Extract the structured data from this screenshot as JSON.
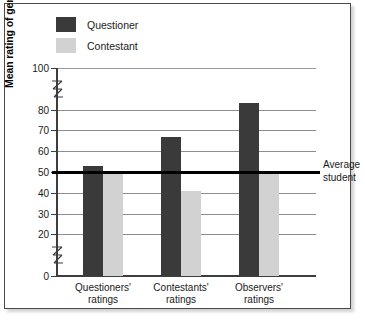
{
  "chart_data": {
    "type": "bar",
    "title": "",
    "xlabel": "",
    "ylabel": "Mean rating of general knowledge",
    "ylim": [
      0,
      100
    ],
    "yticks": [
      0,
      20,
      30,
      40,
      50,
      60,
      70,
      80,
      100
    ],
    "ytick_labels": [
      "0",
      "20",
      "30",
      "40",
      "50",
      "60",
      "70",
      "80",
      "100"
    ],
    "axis_breaks": [
      {
        "between": [
          0,
          20
        ]
      },
      {
        "between": [
          80,
          100
        ]
      }
    ],
    "grid": true,
    "grid_axis": "y",
    "legend_position": "top-left",
    "categories": [
      "Questioners' ratings",
      "Contestants' ratings",
      "Observers' ratings"
    ],
    "series": [
      {
        "name": "Questioner",
        "color": "#3a3a3a",
        "values": [
          53,
          67,
          83
        ]
      },
      {
        "name": "Contestant",
        "color": "#d2d2d2",
        "values": [
          50,
          41,
          50
        ]
      }
    ],
    "annotations": [
      {
        "name": "average-student-reference-line",
        "label_line1": "Average",
        "label_line2": "student",
        "value": 50,
        "color": "#000000"
      }
    ]
  },
  "legend": {
    "items": [
      {
        "label": "Questioner",
        "color": "#3a3a3a",
        "key": "questioner"
      },
      {
        "label": "Contestant",
        "color": "#d2d2d2",
        "key": "contestant"
      }
    ]
  },
  "axis": {
    "y_title": "Mean rating of general knowledge",
    "ticks": [
      {
        "label": "100",
        "value": 100
      },
      {
        "label": "80",
        "value": 80
      },
      {
        "label": "70",
        "value": 70
      },
      {
        "label": "60",
        "value": 60
      },
      {
        "label": "50",
        "value": 50
      },
      {
        "label": "40",
        "value": 40
      },
      {
        "label": "30",
        "value": 30
      },
      {
        "label": "20",
        "value": 20
      },
      {
        "label": "0",
        "value": 0
      }
    ]
  },
  "categories": [
    {
      "line1": "Questioners'",
      "line2": "ratings"
    },
    {
      "line1": "Contestants'",
      "line2": "ratings"
    },
    {
      "line1": "Observers'",
      "line2": "ratings"
    }
  ],
  "annotation": {
    "line1": "Average",
    "line2": "student"
  },
  "colors": {
    "questioner": "#3a3a3a",
    "contestant": "#d2d2d2",
    "reference_line": "#000000",
    "gridline": "#8d8d8d",
    "frame": "#4a4a4a",
    "background": "#ffffff"
  }
}
